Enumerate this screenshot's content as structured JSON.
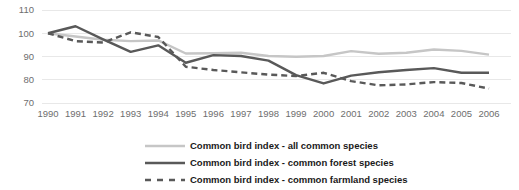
{
  "chart_data": {
    "type": "line",
    "title": "",
    "subtitle": "",
    "xlabel": "",
    "ylabel": "",
    "grid": true,
    "legend_position": "bottom",
    "categories": [
      1990,
      1991,
      1992,
      1993,
      1994,
      1995,
      1996,
      1997,
      1998,
      1999,
      2000,
      2001,
      2002,
      2003,
      2004,
      2005,
      2006
    ],
    "xtick_labels": [
      "1990",
      "1991",
      "1992",
      "1993",
      "1994",
      "1995",
      "1996",
      "1997",
      "1998",
      "1999",
      "2000",
      "2001",
      "2002",
      "2003",
      "2004",
      "2005",
      "2006"
    ],
    "ytick_labels": [
      "110",
      "100",
      "90",
      "80",
      "70"
    ],
    "yticks": [
      110,
      100,
      90,
      80,
      70
    ],
    "ylim": [
      65,
      112
    ],
    "xlim": [
      1990,
      2006
    ],
    "series": [
      {
        "name": "Common bird index - all common species",
        "key": "all_common",
        "style": "solid",
        "color": "#c6c6c6",
        "width": 2.4,
        "values": [
          100.0,
          98.6,
          97.2,
          96.6,
          96.9,
          91.3,
          91.4,
          91.6,
          90.2,
          89.9,
          90.2,
          92.3,
          91.2,
          91.6,
          93.0,
          92.4,
          90.8
        ]
      },
      {
        "name": "Common bird index - common forest species",
        "key": "common_forest",
        "style": "solid",
        "color": "#595959",
        "width": 2.4,
        "values": [
          100.0,
          103.0,
          97.4,
          92.0,
          94.8,
          87.3,
          90.6,
          90.2,
          88.2,
          82.0,
          78.4,
          81.8,
          83.2,
          84.2,
          85.0,
          83.0,
          83.0
        ]
      },
      {
        "name": "Common bird index - common farmland species",
        "key": "common_farmland",
        "style": "dashed",
        "color": "#595959",
        "width": 2.4,
        "values": [
          100.0,
          96.6,
          96.0,
          100.4,
          98.4,
          85.6,
          84.2,
          83.2,
          82.2,
          81.6,
          83.0,
          79.4,
          77.6,
          78.0,
          79.0,
          78.6,
          76.2
        ]
      }
    ],
    "legend": [
      {
        "label": "Common bird index - all common species",
        "color": "#c6c6c6",
        "style": "solid"
      },
      {
        "label": "Common bird index - common forest species",
        "color": "#595959",
        "style": "solid"
      },
      {
        "label": "Common bird index - common farmland species",
        "color": "#595959",
        "style": "dashed"
      }
    ]
  }
}
